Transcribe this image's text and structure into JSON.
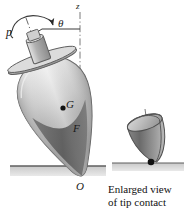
{
  "figure": {
    "labels": {
      "precession": "p",
      "tilt_angle": "θ",
      "vertical_axis": "z",
      "center_of_gravity": "G",
      "force": "F",
      "origin": "O"
    },
    "caption_line1": "Enlarged view",
    "caption_line2": "of tip contact",
    "colors": {
      "ink": "#1a1a1a",
      "ground": "#bdbdbd",
      "ground_edge": "#6e6e6e",
      "body_light": "#e6e6e6",
      "body_mid": "#b4b4b4",
      "body_dark": "#7d7d7d",
      "body_darkest": "#5a5a5a",
      "contact_dot": "#111111"
    }
  }
}
